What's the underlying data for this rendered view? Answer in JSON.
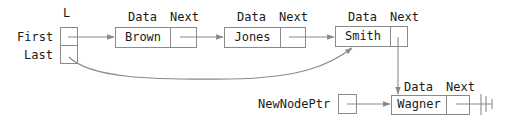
{
  "diagram": {
    "type": "linked-list-insertion",
    "list_header": {
      "name": "L",
      "fields": [
        "First",
        "Last"
      ]
    },
    "field_headers": {
      "data": "Data",
      "next": "Next"
    },
    "nodes": [
      {
        "data": "Brown"
      },
      {
        "data": "Jones"
      },
      {
        "data": "Smith"
      },
      {
        "data": "Wagner"
      }
    ],
    "new_node_pointer": "NewNodePtr",
    "colors": {
      "line": "#8a8a8a",
      "text": "#1a1a1a",
      "background": "#ffffff"
    }
  }
}
